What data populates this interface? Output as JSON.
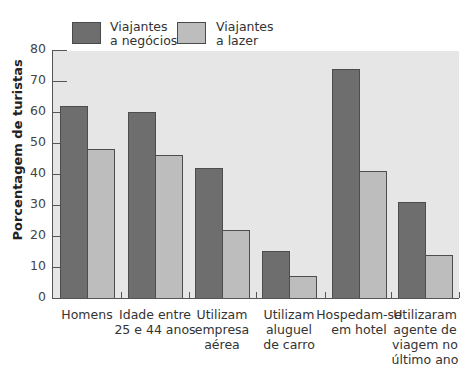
{
  "chart_data": {
    "type": "bar",
    "title": "",
    "xlabel": "",
    "ylabel": "Porcentagem de turistas",
    "ylim": [
      0,
      80
    ],
    "yticks": [
      0,
      10,
      20,
      30,
      40,
      50,
      60,
      70,
      80
    ],
    "grid": false,
    "legend_position": "top",
    "categories": [
      "Homens",
      "Idade entre 25 e 44 anos",
      "Utilizam empresa aérea",
      "Utilizam aluguel de carro",
      "Hospedam-se em hotel",
      "Utilizaram agente de viagem no último ano"
    ],
    "series": [
      {
        "name": "Viajantes a negócios",
        "color": "#6e6e6e",
        "values": [
          62,
          60,
          42,
          15,
          74,
          31
        ]
      },
      {
        "name": "Viajantes a lazer",
        "color": "#bdbdbd",
        "values": [
          48,
          46,
          22,
          7,
          41,
          14
        ]
      }
    ]
  },
  "legend": {
    "business_line1": "Viajantes",
    "business_line2": "a negócios",
    "leisure_line1": "Viajantes",
    "leisure_line2": "a lazer"
  },
  "axis": {
    "ylabel": "Porcentagem de turistas",
    "ticks": [
      "0",
      "10",
      "20",
      "30",
      "40",
      "50",
      "60",
      "70",
      "80"
    ]
  },
  "category_labels": [
    [
      "Homens"
    ],
    [
      "Idade entre",
      "25 e 44 anos"
    ],
    [
      "Utilizam",
      "empresa",
      "aérea"
    ],
    [
      "Utilizam",
      "aluguel",
      "de carro"
    ],
    [
      "Hospedam-se",
      "em hotel"
    ],
    [
      "Utilizaram",
      "agente de",
      "viagem no",
      "último ano"
    ]
  ]
}
